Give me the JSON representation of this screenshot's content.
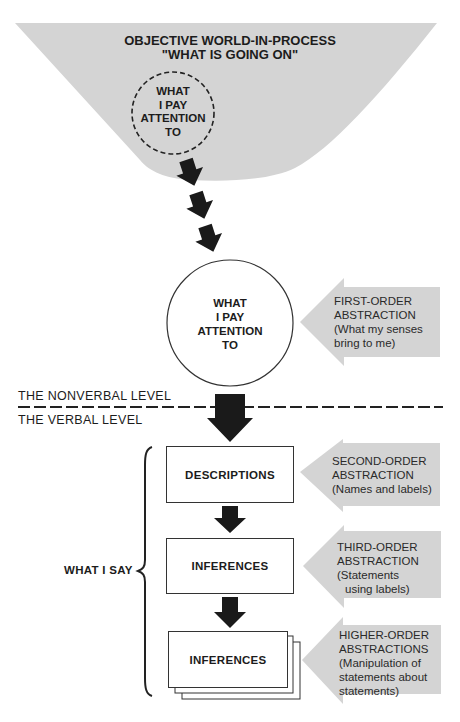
{
  "colors": {
    "gray_fill": "#d4d4d4",
    "arrow_fill": "#1a1a1a",
    "line": "#222222",
    "background": "#ffffff"
  },
  "funnel": {
    "title_line1": "OBJECTIVE WORLD-IN-PROCESS",
    "title_line2": "\"WHAT IS GOING ON\"",
    "dashed_circle": {
      "lines": [
        "WHAT",
        "I PAY",
        "ATTENTION",
        "TO"
      ]
    }
  },
  "attention_circle": {
    "lines": [
      "WHAT",
      "I PAY",
      "ATTENTION",
      "TO"
    ]
  },
  "levels": {
    "nonverbal": "THE NONVERBAL LEVEL",
    "verbal": "THE VERBAL LEVEL"
  },
  "what_i_say": "WHAT I SAY",
  "boxes": [
    {
      "label": "DESCRIPTIONS",
      "stacked": false
    },
    {
      "label": "INFERENCES",
      "stacked": false
    },
    {
      "label": "INFERENCES",
      "stacked": true
    }
  ],
  "abstractions": [
    {
      "lines": [
        "FIRST-ORDER",
        "ABSTRACTION",
        "(What my senses",
        "bring to me)"
      ]
    },
    {
      "lines": [
        "SECOND-ORDER",
        "ABSTRACTION",
        "(Names and labels)"
      ]
    },
    {
      "lines": [
        "THIRD-ORDER",
        "ABSTRACTION",
        "(Statements",
        "using labels)"
      ]
    },
    {
      "lines": [
        "HIGHER-ORDER",
        "ABSTRACTIONS",
        "(Manipulation of",
        "statements about",
        "statements)"
      ]
    }
  ]
}
